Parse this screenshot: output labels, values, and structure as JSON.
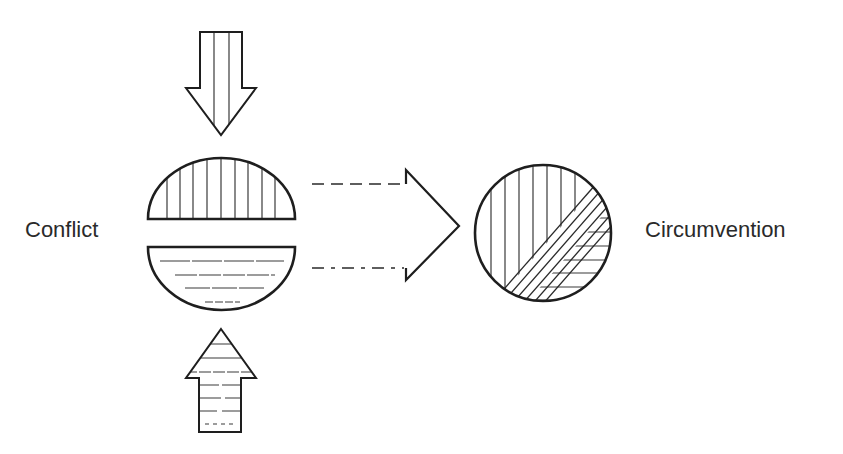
{
  "diagram": {
    "labels": {
      "left": "Conflict",
      "right": "Circumvention"
    },
    "elements": {
      "down_arrow": "force-from-above-arrow, vertical hatching",
      "up_arrow": "force-from-below-arrow, horizontal hatching",
      "top_half_circle": "vertical-hatched half",
      "bottom_half_circle": "horizontal-hatched half",
      "transition_arrow": "dashed open chevron arrow",
      "result_circle": "combined circle with diagonal band"
    },
    "colors": {
      "stroke": "#1e1e1e",
      "hatch": "#3a3a3a",
      "text": "#2a2a2a",
      "background": "#ffffff"
    }
  }
}
